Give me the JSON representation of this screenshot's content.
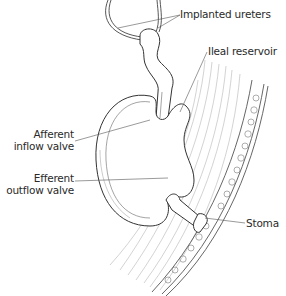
{
  "diagram": {
    "title": "",
    "labels": {
      "implanted_ureters": "Implanted ureters",
      "ileal_reservoir": "Ileal reservoir",
      "afferent_line1": "Afferent",
      "afferent_line2": "inflow valve",
      "efferent_line1": "Efferent",
      "efferent_line2": "outflow valve",
      "stoma": "Stoma"
    },
    "colors": {
      "ink": "#2a2a2a",
      "line": "#555555",
      "hatch": "#9a9a9a",
      "background": "#ffffff"
    }
  }
}
